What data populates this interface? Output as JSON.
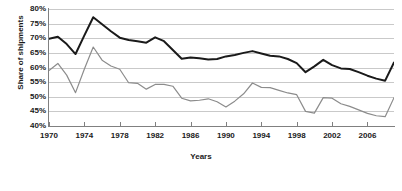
{
  "chart_data": {
    "type": "line",
    "title": "",
    "xlabel": "Years",
    "ylabel": "Share of shipments",
    "xlim": [
      1970,
      2009
    ],
    "ylim": [
      40,
      80
    ],
    "ytick_labels": [
      "80%",
      "75%",
      "70%",
      "65%",
      "60%",
      "55%",
      "50%",
      "45%",
      "40%"
    ],
    "ytick_values": [
      80,
      75,
      70,
      65,
      60,
      55,
      50,
      45,
      40
    ],
    "xtick_labels": [
      "1970",
      "1974",
      "1978",
      "1982",
      "1986",
      "1990",
      "1994",
      "1998",
      "2002",
      "2006"
    ],
    "xtick_values": [
      1970,
      1974,
      1978,
      1982,
      1986,
      1990,
      1994,
      1998,
      2002,
      2006
    ],
    "grid": true,
    "legend": "none",
    "x": [
      1970,
      1971,
      1972,
      1973,
      1974,
      1975,
      1976,
      1977,
      1978,
      1979,
      1980,
      1981,
      1982,
      1983,
      1984,
      1985,
      1986,
      1987,
      1988,
      1989,
      1990,
      1991,
      1992,
      1993,
      1994,
      1995,
      1996,
      1997,
      1998,
      1999,
      2000,
      2001,
      2002,
      2003,
      2004,
      2005,
      2006,
      2007,
      2008,
      2009
    ],
    "series": [
      {
        "name": "upper-dark-series",
        "color": "#1a1a1a",
        "values": [
          69.8,
          70.5,
          68.0,
          64.6,
          71.0,
          77.2,
          74.8,
          72.4,
          70.2,
          69.4,
          69.0,
          68.5,
          70.3,
          69.0,
          66.0,
          63.0,
          63.4,
          63.2,
          62.7,
          62.9,
          63.8,
          64.3,
          65.0,
          65.6,
          64.8,
          64.0,
          63.8,
          62.9,
          61.5,
          58.4,
          60.4,
          62.6,
          60.8,
          59.7,
          59.5,
          58.4,
          57.2,
          56.2,
          55.5,
          61.7
        ]
      },
      {
        "name": "lower-gray-series",
        "color": "#8c8c8c",
        "values": [
          59.0,
          61.4,
          57.4,
          51.4,
          59.5,
          67.0,
          62.5,
          60.5,
          59.4,
          54.8,
          54.6,
          52.6,
          54.2,
          54.2,
          53.6,
          49.5,
          48.6,
          48.8,
          49.3,
          48.3,
          46.5,
          48.5,
          51.0,
          54.7,
          53.2,
          53.1,
          52.2,
          51.3,
          50.7,
          45.0,
          44.4,
          49.7,
          49.5,
          47.6,
          46.7,
          45.5,
          44.3,
          43.5,
          43.2,
          49.7
        ]
      }
    ]
  }
}
